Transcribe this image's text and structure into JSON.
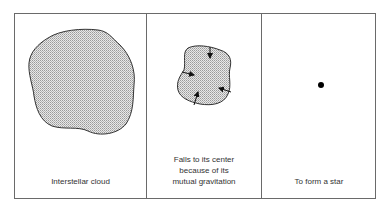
{
  "figure": {
    "panels": [
      {
        "id": "cloud",
        "caption": "Interstellar cloud"
      },
      {
        "id": "collapse",
        "caption_lines": [
          "Falls to its center",
          "because of its",
          "mutual gravitation"
        ]
      },
      {
        "id": "star",
        "caption": "To form a star"
      }
    ]
  }
}
